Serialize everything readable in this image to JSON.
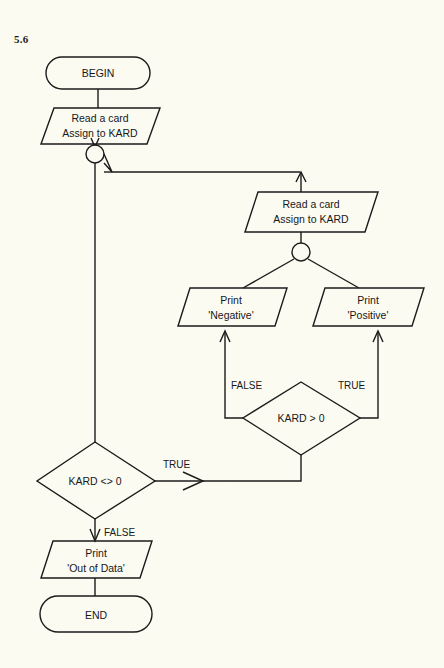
{
  "figure": {
    "label": "5.6"
  },
  "diagram": {
    "type": "flowchart",
    "nodes": [
      {
        "id": "begin",
        "shape": "terminator",
        "lines": [
          "BEGIN"
        ]
      },
      {
        "id": "read1",
        "shape": "parallelogram",
        "lines": [
          "Read a card",
          "Assign to KARD"
        ]
      },
      {
        "id": "connector1",
        "shape": "circle",
        "lines": []
      },
      {
        "id": "read2",
        "shape": "parallelogram",
        "lines": [
          "Read a card",
          "Assign to KARD"
        ]
      },
      {
        "id": "connector2",
        "shape": "circle",
        "lines": []
      },
      {
        "id": "print-negative",
        "shape": "parallelogram",
        "lines": [
          "Print",
          "'Negative'"
        ]
      },
      {
        "id": "print-positive",
        "shape": "parallelogram",
        "lines": [
          "Print",
          "'Positive'"
        ]
      },
      {
        "id": "decision-kard-gt-0",
        "shape": "diamond",
        "lines": [
          "KARD > 0"
        ]
      },
      {
        "id": "decision-kard-ne-0",
        "shape": "diamond",
        "lines": [
          "KARD <> 0"
        ]
      },
      {
        "id": "print-out-of-data",
        "shape": "parallelogram",
        "lines": [
          "Print",
          "'Out of Data'"
        ]
      },
      {
        "id": "end",
        "shape": "terminator",
        "lines": [
          "END"
        ]
      }
    ],
    "edge_labels": {
      "kard_gt_false": "FALSE",
      "kard_gt_true": "TRUE",
      "kard_ne_true": "TRUE",
      "kard_ne_false": "FALSE"
    },
    "colors": {
      "background": "#fbfbf2",
      "stroke": "#1b1b1b",
      "text": "#17171a"
    }
  }
}
